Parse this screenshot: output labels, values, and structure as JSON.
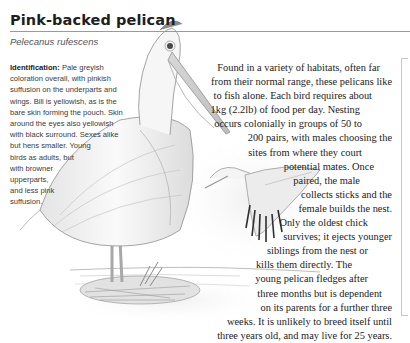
{
  "header": {
    "title": "Pink-backed pelican",
    "scientific_name": "Pelecanus rufescens"
  },
  "identification": {
    "label": "Identification:",
    "lines": [
      " Pale greyish",
      "coloration overall, with pinkish",
      "suffusion on the underparts and",
      "wings. Bill is yellowish, as is the",
      "bare skin forming the pouch. Skin",
      "around the eyes also yellowish",
      "with black surround. Sexes alike",
      "but hens smaller. Young",
      "birds as adults, but",
      "with browner",
      "upperparts,",
      "and less pink",
      "suffusion."
    ]
  },
  "description": {
    "lines": [
      "Found in a variety of habitats, often far",
      "from their normal range, these pelicans like",
      "to fish alone. Each bird requires about",
      "1kg (2.2lb) of food per day. Nesting",
      "occurs colonially in groups of 50 to",
      "200 pairs, with males choosing the",
      "sites from where they court",
      "potential mates. Once",
      "paired, the male",
      "collects sticks and the",
      "female builds the nest.",
      "Only the oldest chick",
      "survives; it ejects younger",
      "siblings from the nest or",
      "kills them directly. The",
      "young pelican fledges after",
      "three months but is dependent",
      "on its parents for a further three",
      "weeks. It is unlikely to breed itself until",
      "three years old, and may live for 25 years."
    ],
    "line_right_margins": [
      30,
      18,
      38,
      50,
      48,
      18,
      48,
      36,
      50,
      18,
      18,
      42,
      18,
      42,
      58,
      42,
      28,
      18,
      18,
      18
    ]
  },
  "illustration": {
    "subjects": [
      "standing-pelican",
      "flying-pelican",
      "nest"
    ]
  }
}
